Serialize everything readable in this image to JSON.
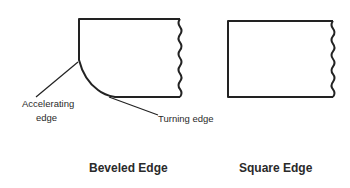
{
  "diagram": {
    "beveled": {
      "title": "Beveled Edge",
      "annotations": {
        "accelerating_line1": "Accelerating",
        "accelerating_line2": "edge",
        "turning": "Turning edge"
      }
    },
    "square": {
      "title": "Square Edge"
    },
    "colors": {
      "stroke": "#222222",
      "text": "#2a2a2a",
      "background": "#ffffff"
    }
  }
}
